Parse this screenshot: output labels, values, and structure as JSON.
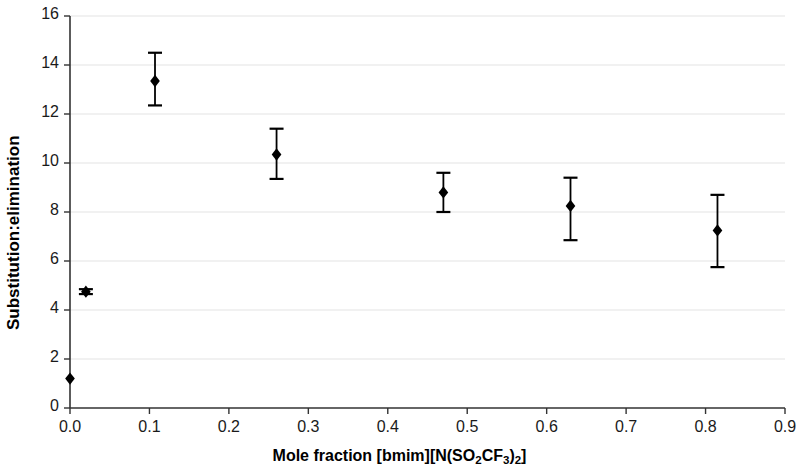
{
  "chart_data": {
    "type": "scatter",
    "title": "",
    "xlabel": "Mole fraction [bmim][N(SO2CF3)2]",
    "xlabel_parts": {
      "prefix": "Mole fraction [bmim][N(SO",
      "sub1": "2",
      "mid": "CF",
      "sub2": "3",
      "mid2": ")",
      "sub3": "2",
      "suffix": "]"
    },
    "ylabel": "Substitution:elimination",
    "xlim": [
      0.0,
      0.9
    ],
    "ylim": [
      0,
      16
    ],
    "xticks": [
      "0.0",
      "0.1",
      "0.2",
      "0.3",
      "0.4",
      "0.5",
      "0.6",
      "0.7",
      "0.8",
      "0.9"
    ],
    "xtick_values": [
      0.0,
      0.1,
      0.2,
      0.3,
      0.4,
      0.5,
      0.6,
      0.7,
      0.8,
      0.9
    ],
    "yticks": [
      "0",
      "2",
      "4",
      "6",
      "8",
      "10",
      "12",
      "14",
      "16"
    ],
    "ytick_values": [
      0,
      2,
      4,
      6,
      8,
      10,
      12,
      14,
      16
    ],
    "grid": "horizontal",
    "grid_color": "#e3e3e3",
    "legend": "none",
    "marker": "diamond",
    "marker_color": "#000000",
    "errorbar_color": "#000000",
    "x": [
      0.0,
      0.02,
      0.107,
      0.26,
      0.47,
      0.63,
      0.815
    ],
    "y": [
      1.2,
      4.75,
      13.35,
      10.35,
      8.8,
      8.25,
      7.25
    ],
    "yerr_low": [
      1.2,
      4.65,
      12.35,
      9.35,
      8.0,
      6.85,
      5.75
    ],
    "yerr_high": [
      1.2,
      4.85,
      14.5,
      11.4,
      9.6,
      9.4,
      8.7
    ],
    "points": [
      {
        "x": 0.0,
        "y": 1.2,
        "low": 1.2,
        "high": 1.2
      },
      {
        "x": 0.02,
        "y": 4.75,
        "low": 4.65,
        "high": 4.85
      },
      {
        "x": 0.107,
        "y": 13.35,
        "low": 12.35,
        "high": 14.5
      },
      {
        "x": 0.26,
        "y": 10.35,
        "low": 9.35,
        "high": 11.4
      },
      {
        "x": 0.47,
        "y": 8.8,
        "low": 8.0,
        "high": 9.6
      },
      {
        "x": 0.63,
        "y": 8.25,
        "low": 6.85,
        "high": 9.4
      },
      {
        "x": 0.815,
        "y": 7.25,
        "low": 5.75,
        "high": 8.7
      }
    ]
  },
  "layout": {
    "plot_left": 70,
    "plot_right": 785,
    "plot_top": 16,
    "plot_bottom": 408,
    "axis_color": "#333333"
  }
}
